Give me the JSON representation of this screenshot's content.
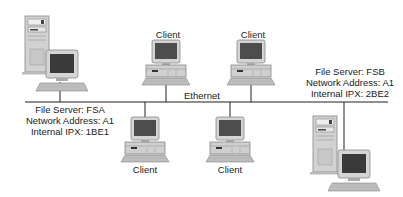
{
  "diagram": {
    "network_label": "Ethernet",
    "servers": [
      {
        "id": "fsa",
        "name_line": "File Server: FSA",
        "address_line": "Network Address: A1",
        "ipx_line": "Internal IPX: 1BE1"
      },
      {
        "id": "fsb",
        "name_line": "File Server: FSB",
        "address_line": "Network Address: A1",
        "ipx_line": "Internal IPX: 2BE2"
      }
    ],
    "clients": [
      {
        "label": "Client",
        "position": "top"
      },
      {
        "label": "Client",
        "position": "top"
      },
      {
        "label": "Client",
        "position": "bottom"
      },
      {
        "label": "Client",
        "position": "bottom"
      }
    ],
    "colors": {
      "line": "#222222",
      "monitor_screen": "#555555",
      "device_body": "#cfcfcf",
      "device_edge": "#888888"
    }
  }
}
